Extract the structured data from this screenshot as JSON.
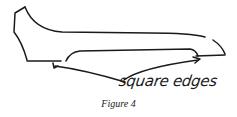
{
  "figure": {
    "annotation": "square edges",
    "caption": "Figure 4",
    "ink_color": "#1a1a1a"
  }
}
